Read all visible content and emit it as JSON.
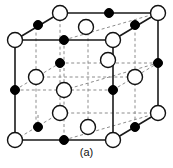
{
  "figure": {
    "caption": "(a)",
    "structure_name": "rock-salt-unit-cell",
    "colors": {
      "background": "#ffffff",
      "edge_solid": "#1a1a1a",
      "edge_dashed": "#8c8c8c",
      "anion_fill": "#ffffff",
      "anion_stroke": "#111111",
      "cation_fill": "#000000",
      "cation_stroke": "#000000",
      "caption_text": "#111111"
    },
    "geometry": {
      "front_face": [
        [
          15,
          40
        ],
        [
          113,
          40
        ],
        [
          113,
          140
        ],
        [
          15,
          140
        ]
      ],
      "back_face": [
        [
          60,
          13
        ],
        [
          158,
          13
        ],
        [
          158,
          113
        ],
        [
          60,
          113
        ]
      ],
      "depth_offset": [
        45,
        -27
      ],
      "cell_width": 98,
      "cell_height": 100
    },
    "solid_edges": [
      [
        [
          15,
          40
        ],
        [
          113,
          40
        ]
      ],
      [
        [
          15,
          40
        ],
        [
          15,
          140
        ]
      ],
      [
        [
          113,
          40
        ],
        [
          113,
          140
        ]
      ],
      [
        [
          15,
          140
        ],
        [
          113,
          140
        ]
      ],
      [
        [
          60,
          13
        ],
        [
          158,
          13
        ]
      ],
      [
        [
          158,
          13
        ],
        [
          158,
          113
        ]
      ],
      [
        [
          113,
          140
        ],
        [
          158,
          113
        ]
      ],
      [
        [
          15,
          40
        ],
        [
          60,
          13
        ]
      ],
      [
        [
          113,
          40
        ],
        [
          158,
          13
        ]
      ]
    ],
    "dashed_edges": [
      [
        [
          60,
          13
        ],
        [
          60,
          113
        ]
      ],
      [
        [
          60,
          113
        ],
        [
          158,
          113
        ]
      ],
      [
        [
          15,
          140
        ],
        [
          60,
          113
        ]
      ],
      [
        [
          36,
          27
        ],
        [
          36,
          127
        ]
      ],
      [
        [
          88,
          27
        ],
        [
          88,
          127
        ]
      ],
      [
        [
          64,
          40
        ],
        [
          64,
          140
        ]
      ],
      [
        [
          135,
          27
        ],
        [
          135,
          127
        ]
      ],
      [
        [
          15,
          90
        ],
        [
          113,
          90
        ]
      ],
      [
        [
          60,
          63
        ],
        [
          158,
          63
        ]
      ],
      [
        [
          36,
          77
        ],
        [
          135,
          77
        ]
      ],
      [
        [
          64,
          40
        ],
        [
          158,
          13
        ]
      ],
      [
        [
          64,
          90
        ],
        [
          158,
          63
        ]
      ],
      [
        [
          64,
          140
        ],
        [
          158,
          113
        ]
      ],
      [
        [
          15,
          90
        ],
        [
          60,
          63
        ]
      ],
      [
        [
          113,
          90
        ],
        [
          158,
          63
        ]
      ],
      [
        [
          38,
          115
        ],
        [
          38,
          127
        ]
      ]
    ],
    "atoms": {
      "open_circle_radius": 7.5,
      "filled_circle_radius": 4.5,
      "open_circles": [
        {
          "id": "corner-back-top-left",
          "x": 60,
          "y": 13
        },
        {
          "id": "corner-back-top-right",
          "x": 158,
          "y": 13
        },
        {
          "id": "corner-front-top-left",
          "x": 15,
          "y": 40
        },
        {
          "id": "corner-front-top-right",
          "x": 113,
          "y": 40
        },
        {
          "id": "face-top-center",
          "x": 86,
          "y": 27
        },
        {
          "id": "face-left-center",
          "x": 36,
          "y": 77
        },
        {
          "id": "face-right-center",
          "x": 135,
          "y": 77
        },
        {
          "id": "body-center",
          "x": 64,
          "y": 90
        },
        {
          "id": "face-back-center",
          "x": 108,
          "y": 60
        },
        {
          "id": "face-front-center",
          "x": 60,
          "y": 113
        },
        {
          "id": "face-bottom-center",
          "x": 88,
          "y": 127
        },
        {
          "id": "corner-front-bottom-left",
          "x": 15,
          "y": 140
        },
        {
          "id": "corner-front-bottom-right",
          "x": 113,
          "y": 140
        },
        {
          "id": "corner-back-bottom-right",
          "x": 158,
          "y": 113
        }
      ],
      "filled_circles": [
        {
          "id": "edge-back-top",
          "x": 109,
          "y": 13
        },
        {
          "id": "edge-top-left",
          "x": 38,
          "y": 25
        },
        {
          "id": "edge-front-top",
          "x": 64,
          "y": 40
        },
        {
          "id": "edge-top-right",
          "x": 135,
          "y": 25
        },
        {
          "id": "edge-back-left-mid",
          "x": 60,
          "y": 63
        },
        {
          "id": "inner-mid-right",
          "x": 113,
          "y": 90
        },
        {
          "id": "edge-left-mid",
          "x": 15,
          "y": 90
        },
        {
          "id": "edge-right-mid",
          "x": 158,
          "y": 63
        },
        {
          "id": "edge-bottom-left",
          "x": 38,
          "y": 127
        },
        {
          "id": "edge-front-bottom",
          "x": 64,
          "y": 140
        },
        {
          "id": "edge-bottom-right",
          "x": 135,
          "y": 127
        }
      ]
    }
  }
}
